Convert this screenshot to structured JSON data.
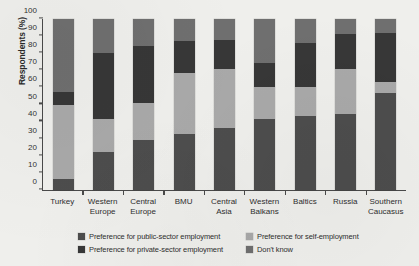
{
  "chart_data": {
    "type": "bar",
    "stacked": true,
    "stack_mode": "percent",
    "title": "",
    "xlabel": "",
    "ylabel": "Respondents (%)",
    "ylim": [
      0,
      100
    ],
    "yticks": [
      0,
      10,
      20,
      30,
      40,
      50,
      60,
      70,
      80,
      90,
      100
    ],
    "ytick_labels": [
      "0",
      "10",
      "20",
      "30",
      "40",
      "50",
      "60",
      "70",
      "80",
      "90",
      "100"
    ],
    "grid": false,
    "legend_position": "bottom",
    "categories": [
      "Turkey",
      "Western Europe",
      "Central Europe",
      "BMU",
      "Central Asia",
      "Western Balkans",
      "Baltics",
      "Russia",
      "Southern Caucasus"
    ],
    "category_lines": [
      [
        "Turkey"
      ],
      [
        "Western",
        "Europe"
      ],
      [
        "Central",
        "Europe"
      ],
      [
        "BMU"
      ],
      [
        "Central",
        "Asia"
      ],
      [
        "Western",
        "Balkans"
      ],
      [
        "Baltics"
      ],
      [
        "Russia"
      ],
      [
        "Southern",
        "Caucasus"
      ]
    ],
    "series": [
      {
        "name": "Preference for public-sector employment",
        "color": "#4d4d4d",
        "values": [
          6.5,
          22.0,
          29.5,
          33.0,
          36.0,
          41.5,
          43.5,
          44.5,
          56.5
        ]
      },
      {
        "name": "Preference for self-employment",
        "color": "#a9a9a9",
        "values": [
          43.5,
          19.5,
          21.5,
          35.5,
          34.5,
          18.5,
          16.5,
          26.0,
          6.5
        ]
      },
      {
        "name": "Preference for private-sector employment",
        "color": "#373737",
        "values": [
          7.5,
          38.5,
          33.5,
          18.5,
          17.0,
          14.5,
          26.0,
          20.5,
          29.0
        ]
      },
      {
        "name": "Don't know",
        "color": "#6f6f6f",
        "values": [
          42.5,
          20.0,
          15.5,
          13.0,
          12.5,
          25.5,
          14.0,
          9.0,
          8.0
        ]
      }
    ],
    "cumulative_tops": {
      "Turkey": [
        6.5,
        50.0,
        57.5,
        100
      ],
      "Western Europe": [
        22.0,
        41.5,
        80.0,
        100
      ],
      "Central Europe": [
        29.5,
        51.0,
        84.5,
        100
      ],
      "BMU": [
        33.0,
        68.5,
        87.0,
        100
      ],
      "Central Asia": [
        36.0,
        70.5,
        87.5,
        100
      ],
      "Western Balkans": [
        41.5,
        60.0,
        74.5,
        100
      ],
      "Baltics": [
        43.5,
        60.0,
        86.0,
        100
      ],
      "Russia": [
        44.5,
        70.5,
        91.0,
        100
      ],
      "Southern Caucasus": [
        56.5,
        63.0,
        92.0,
        100
      ]
    }
  },
  "legend": {
    "items": [
      {
        "label": "Preference for public-sector employment",
        "color": "#4d4d4d"
      },
      {
        "label": "Preference for self-employment",
        "color": "#a9a9a9"
      },
      {
        "label": "Preference for private-sector employment",
        "color": "#373737"
      },
      {
        "label": "Don't know",
        "color": "#6f6f6f"
      }
    ]
  }
}
